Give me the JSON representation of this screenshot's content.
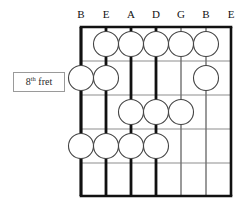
{
  "diagram": {
    "fret_label": {
      "number": "8",
      "ordinal_suffix": "th",
      "word": "fret",
      "full_text": "8th fret"
    },
    "string_labels": [
      "B",
      "E",
      "A",
      "D",
      "G",
      "B",
      "E"
    ],
    "string_count": 7,
    "fret_space_count": 5,
    "fret_line_count": 6,
    "thick_strings": [
      1,
      2,
      3,
      4
    ],
    "thin_strings": [
      5,
      6,
      7
    ],
    "colors": {
      "grid_line": "#8d8d8d",
      "board_edge": "#111111",
      "string_thick": "#111111",
      "string_thin": "#6f6f6f",
      "dot_fill": "#ffffff",
      "dot_stroke": "#444444",
      "label_box_border": "#9a9a9a",
      "text": "#111111",
      "background": "#ffffff"
    },
    "geometry": {
      "board_left": 81,
      "board_top": 27,
      "board_right": 231,
      "board_bottom": 196,
      "string_x": [
        81,
        106,
        131,
        156,
        181,
        206,
        231
      ],
      "fret_y": [
        27,
        61,
        95,
        129,
        163,
        196
      ],
      "dot_radius": 12.5,
      "header_y": 8
    },
    "finger_positions": [
      {
        "fret_space": 1,
        "strings": [
          2,
          3,
          4,
          5,
          6
        ]
      },
      {
        "fret_space": 2,
        "strings": [
          1,
          2,
          6
        ]
      },
      {
        "fret_space": 3,
        "strings": [
          3,
          4,
          5
        ]
      },
      {
        "fret_space": 4,
        "strings": [
          1,
          2,
          3,
          4
        ]
      },
      {
        "fret_space": 5,
        "strings": []
      }
    ]
  }
}
